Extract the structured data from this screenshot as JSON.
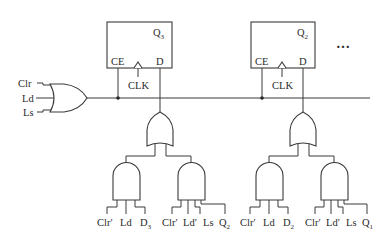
{
  "diagram": {
    "control_inputs": [
      "Clr",
      "Ld",
      "Ls"
    ],
    "flipflops": [
      {
        "name": "Q",
        "sub": "3",
        "pins": {
          "ce": "CE",
          "d": "D",
          "clk": "CLK"
        }
      },
      {
        "name": "Q",
        "sub": "2",
        "pins": {
          "ce": "CE",
          "d": "D",
          "clk": "CLK"
        }
      }
    ],
    "continuation": "…",
    "stages": [
      {
        "and1_inputs": [
          {
            "text": "Clr′"
          },
          {
            "text": "Ld"
          },
          {
            "text": "D",
            "sub": "3"
          }
        ],
        "and2_inputs": [
          {
            "text": "Clr′"
          },
          {
            "text": "Ld′"
          },
          {
            "text": "Ls"
          },
          {
            "text": "Q",
            "sub": "2"
          }
        ]
      },
      {
        "and1_inputs": [
          {
            "text": "Clr′"
          },
          {
            "text": "Ld"
          },
          {
            "text": "D",
            "sub": "2"
          }
        ],
        "and2_inputs": [
          {
            "text": "Clr′"
          },
          {
            "text": "Ld′"
          },
          {
            "text": "Ls"
          },
          {
            "text": "Q",
            "sub": "1"
          }
        ]
      }
    ]
  }
}
